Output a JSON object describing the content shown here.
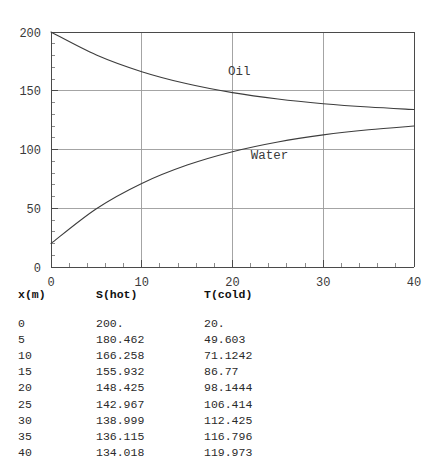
{
  "chart_data": {
    "type": "line",
    "title": "",
    "xlabel": "",
    "ylabel": "",
    "xlim": [
      0,
      40
    ],
    "ylim": [
      0,
      200
    ],
    "grid": true,
    "legend": "inline-curve-labels",
    "x_ticks": [
      "0",
      "10",
      "20",
      "30",
      "40"
    ],
    "x_tick_values": [
      0,
      10,
      20,
      30,
      40
    ],
    "y_ticks": [
      "0",
      "50",
      "100",
      "150",
      "200"
    ],
    "y_tick_values": [
      0,
      50,
      100,
      150,
      200
    ],
    "x": [
      0,
      5,
      10,
      15,
      20,
      25,
      30,
      35,
      40
    ],
    "series": [
      {
        "name": "Oil",
        "label": "Oil",
        "label_x": 19.5,
        "label_y": 163,
        "color": "#3d3d3d",
        "values": [
          200.0,
          180.462,
          166.258,
          155.932,
          148.425,
          142.967,
          138.999,
          136.115,
          134.018
        ]
      },
      {
        "name": "Water",
        "label": "Water",
        "label_x": 22.0,
        "label_y": 92,
        "color": "#3d3d3d",
        "values": [
          20.0,
          49.603,
          71.1242,
          86.77,
          98.1444,
          106.414,
          112.425,
          116.796,
          119.973
        ]
      }
    ]
  },
  "table": {
    "headers": [
      "x(m)",
      "S(hot)",
      "T(cold)"
    ],
    "rows": [
      [
        "0",
        "200.",
        "20."
      ],
      [
        "5",
        "180.462",
        "49.603"
      ],
      [
        "10",
        "166.258",
        "71.1242"
      ],
      [
        "15",
        "155.932",
        "86.77"
      ],
      [
        "20",
        "148.425",
        "98.1444"
      ],
      [
        "25",
        "142.967",
        "106.414"
      ],
      [
        "30",
        "138.999",
        "112.425"
      ],
      [
        "35",
        "136.115",
        "116.796"
      ],
      [
        "40",
        "134.018",
        "119.973"
      ]
    ]
  }
}
